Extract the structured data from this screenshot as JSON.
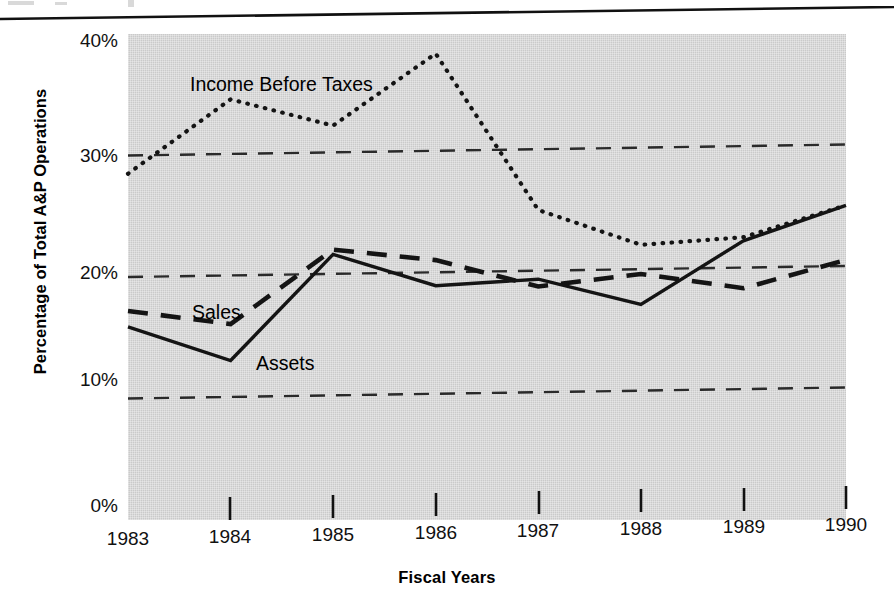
{
  "page": {
    "top_fragment": "",
    "background_color": "#ffffff",
    "plot_background_color": "#cacaca",
    "ink_color": "#1a1a1a"
  },
  "chart_data": {
    "type": "line",
    "title": "",
    "xlabel": "Fiscal Years",
    "ylabel": "Percentage of Total A&P Operations",
    "categories": [
      "1983",
      "1984",
      "1985",
      "1986",
      "1987",
      "1988",
      "1989",
      "1990"
    ],
    "x_tick_labels": [
      "1983",
      "1984",
      "1985",
      "1986",
      "1987",
      "1988",
      "1989",
      "1990"
    ],
    "y_tick_labels": [
      "0%",
      "10%",
      "20%",
      "30%",
      "40%"
    ],
    "y_tick_values": [
      0,
      10,
      20,
      30,
      40
    ],
    "ylim": [
      0,
      40
    ],
    "grid": "horizontal-dashed",
    "gridlines": [
      10,
      20,
      30
    ],
    "legend": "inline-annotations",
    "series": [
      {
        "name": "Income Before Taxes",
        "style": "dotted",
        "values": [
          28.5,
          34.5,
          32.2,
          38.0,
          25.0,
          22.0,
          22.5,
          25.0
        ]
      },
      {
        "name": "Sales",
        "style": "dashed",
        "values": [
          17.2,
          16.0,
          22.0,
          21.0,
          18.7,
          19.6,
          18.3,
          20.5
        ]
      },
      {
        "name": "Assets",
        "style": "solid",
        "values": [
          15.9,
          13.0,
          21.6,
          18.9,
          19.3,
          17.1,
          22.2,
          25.0
        ]
      }
    ],
    "annotations": [
      {
        "text": "Income Before Taxes",
        "series": "Income Before Taxes"
      },
      {
        "text": "Sales",
        "series": "Sales"
      },
      {
        "text": "Assets",
        "series": "Assets"
      }
    ]
  }
}
